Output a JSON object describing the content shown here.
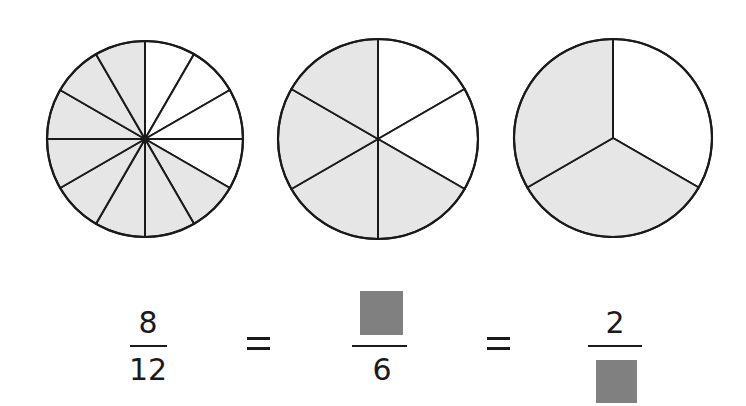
{
  "colors": {
    "shaded": "#e6e6e6",
    "unshaded": "#ffffff",
    "stroke": "#1a1a1a",
    "blank_box": "#808080"
  },
  "circles": [
    {
      "cx": 145,
      "cy": 139,
      "r": 98,
      "parts": 12,
      "shaded": 8
    },
    {
      "cx": 378,
      "cy": 139,
      "r": 100,
      "parts": 6,
      "shaded": 4
    },
    {
      "cx": 613,
      "cy": 138,
      "r": 99,
      "parts": 3,
      "shaded": 2
    }
  ],
  "equation": {
    "fraction1": {
      "numerator": "8",
      "denominator": "12"
    },
    "equals1": "=",
    "fraction2": {
      "numerator": "[blank]",
      "denominator": "6"
    },
    "equals2": "=",
    "fraction3": {
      "numerator": "2",
      "denominator": "[blank]"
    }
  }
}
